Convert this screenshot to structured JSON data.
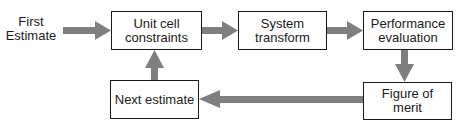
{
  "diagram": {
    "start_label": "First\nEstimate",
    "nodes": [
      {
        "id": "unit_cell",
        "label": "Unit cell constraints",
        "line1": "Unit cell",
        "line2": "constraints"
      },
      {
        "id": "system_transform",
        "label": "System transform",
        "line1": "System",
        "line2": "transform"
      },
      {
        "id": "performance_eval",
        "label": "Performance evaluation",
        "line1": "Performance",
        "line2": "evaluation"
      },
      {
        "id": "figure_of_merit",
        "label": "Figure of merit",
        "line1": "Figure of",
        "line2": "merit"
      },
      {
        "id": "next_estimate",
        "label": "Next estimate",
        "line1": "Next estimate",
        "line2": ""
      }
    ],
    "edges": [
      {
        "from": "First Estimate",
        "to": "unit_cell"
      },
      {
        "from": "unit_cell",
        "to": "system_transform"
      },
      {
        "from": "system_transform",
        "to": "performance_eval"
      },
      {
        "from": "performance_eval",
        "to": "figure_of_merit"
      },
      {
        "from": "figure_of_merit",
        "to": "next_estimate"
      },
      {
        "from": "next_estimate",
        "to": "unit_cell"
      }
    ],
    "colors": {
      "arrow": "#7f7f7f",
      "border": "#1a1a1a",
      "text": "#1a1a1a"
    }
  },
  "start": {
    "line1": "First",
    "line2": "Estimate"
  }
}
